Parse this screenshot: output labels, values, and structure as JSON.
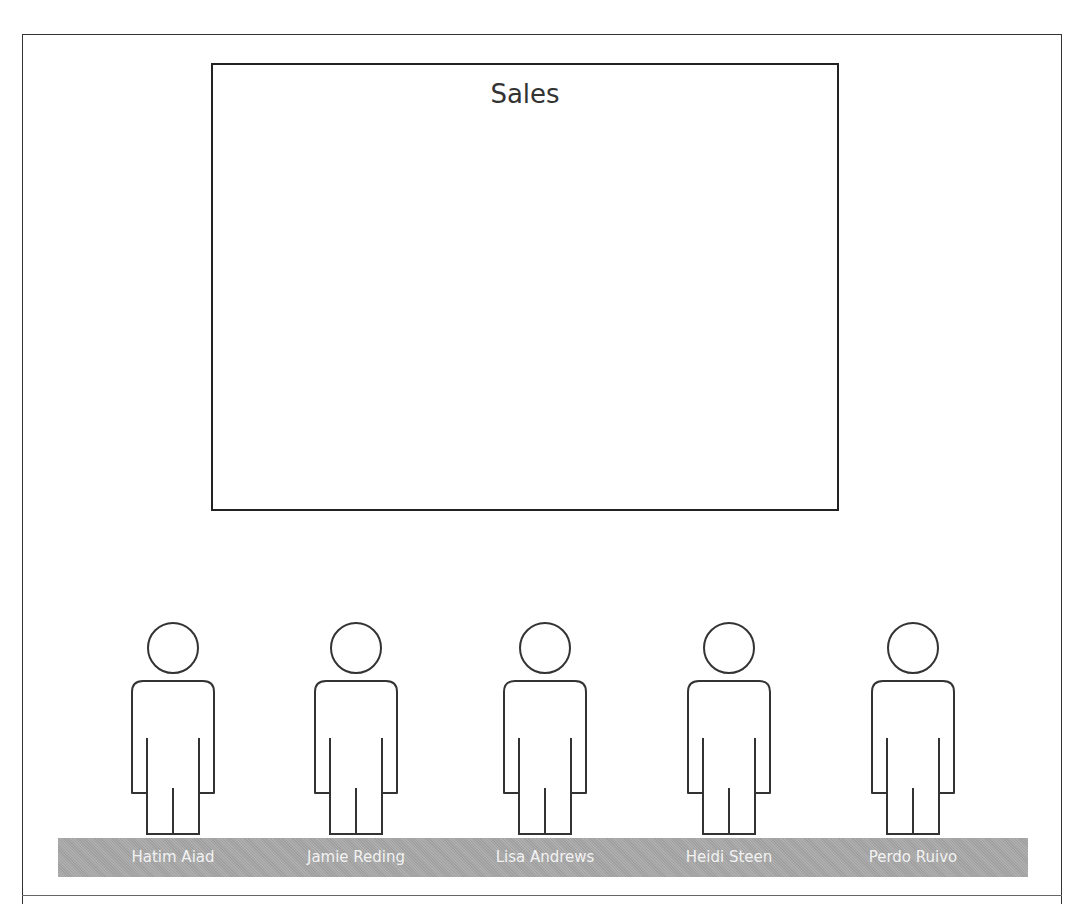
{
  "sales_box": {
    "title": "Sales"
  },
  "people": [
    {
      "name": "Hatim Aiad",
      "icon": "person-outline-icon",
      "center_x": 173
    },
    {
      "name": "Jamie Reding",
      "icon": "person-outline-icon",
      "center_x": 356
    },
    {
      "name": "Lisa Andrews",
      "icon": "person-outline-icon",
      "center_x": 545
    },
    {
      "name": "Heidi Steen",
      "icon": "person-outline-icon",
      "center_x": 729
    },
    {
      "name": "Perdo Ruivo",
      "icon": "person-outline-icon",
      "center_x": 913
    }
  ],
  "colors": {
    "label_bar": "#a8a8a8",
    "label_text": "#f2f2f2",
    "outline": "#333333"
  }
}
